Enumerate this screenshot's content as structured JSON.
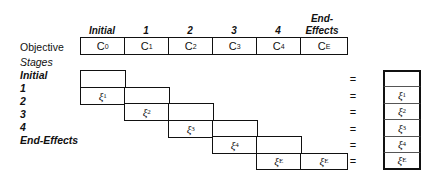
{
  "header": {
    "columns": [
      "Initial",
      "1",
      "2",
      "3",
      "4",
      "End-\nEffects"
    ],
    "end_effects_line1": "End-",
    "end_effects_line2": "Effects"
  },
  "objective": {
    "label": "Objective",
    "cells": [
      {
        "base": "C",
        "sub": "0"
      },
      {
        "base": "C",
        "sub": "1"
      },
      {
        "base": "C",
        "sub": "2"
      },
      {
        "base": "C",
        "sub": "3"
      },
      {
        "base": "C",
        "sub": "4"
      },
      {
        "base": "C",
        "sub": "E"
      }
    ]
  },
  "stages": {
    "label": "Stages",
    "rows": [
      "Initial",
      "1",
      "2",
      "3",
      "4",
      "End-Effects"
    ]
  },
  "matrix": {
    "rows": [
      {
        "cells": [
          {
            "col": 0,
            "text": ""
          }
        ]
      },
      {
        "cells": [
          {
            "col": 0,
            "base": "ξ",
            "sub": "1"
          },
          {
            "col": 1,
            "text": ""
          }
        ]
      },
      {
        "cells": [
          {
            "col": 1,
            "base": "ξ",
            "sub": "2"
          },
          {
            "col": 2,
            "text": ""
          }
        ]
      },
      {
        "cells": [
          {
            "col": 2,
            "base": "ξ",
            "sub": "3"
          },
          {
            "col": 3,
            "text": ""
          }
        ]
      },
      {
        "cells": [
          {
            "col": 3,
            "base": "ξ",
            "sub": "4"
          },
          {
            "col": 4,
            "text": ""
          }
        ]
      },
      {
        "cells": [
          {
            "col": 4,
            "base": "ξ",
            "sub": "E"
          },
          {
            "col": 5,
            "base": "ξ",
            "sub": "E"
          }
        ]
      }
    ]
  },
  "equals_sign": "=",
  "rhs": {
    "cells": [
      {
        "base": "",
        "sub": ""
      },
      {
        "base": "ξ",
        "sub": "1"
      },
      {
        "base": "ξ",
        "sub": "2"
      },
      {
        "base": "ξ",
        "sub": "3"
      },
      {
        "base": "ξ",
        "sub": "4"
      },
      {
        "base": "ξ",
        "sub": "E"
      }
    ]
  }
}
